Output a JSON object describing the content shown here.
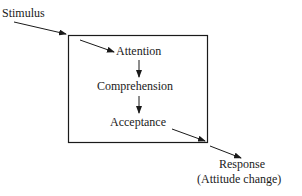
{
  "diagram": {
    "stimulus": "Stimulus",
    "stages": [
      "Attention",
      "Comprehension",
      "Acceptance"
    ],
    "response": "Response",
    "response_sub": "(Attitude change)"
  }
}
